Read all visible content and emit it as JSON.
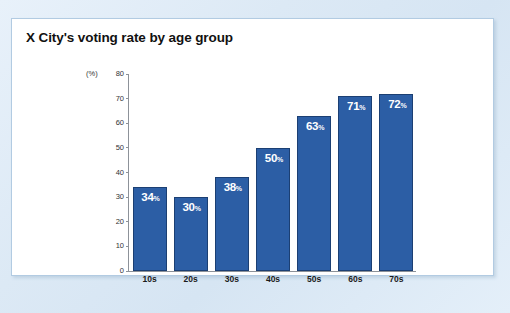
{
  "card": {
    "title": "X City's voting rate by age group",
    "background_color": "#ffffff",
    "border_color": "#b2cbe2"
  },
  "page": {
    "background_color": "#dce9f5"
  },
  "chart_data": {
    "type": "bar",
    "title": "X City's voting rate by age group",
    "xlabel": "",
    "ylabel": "",
    "unit_label": "(%)",
    "categories": [
      "10s",
      "20s",
      "30s",
      "40s",
      "50s",
      "60s",
      "70s"
    ],
    "values": [
      34,
      30,
      38,
      50,
      63,
      71,
      72
    ],
    "value_labels": [
      "34%",
      "30%",
      "38%",
      "50%",
      "63%",
      "71%",
      "72%"
    ],
    "value_suffix": "%",
    "ylim": [
      0,
      80
    ],
    "ytick_step": 10,
    "yticks": [
      80,
      70,
      60,
      50,
      40,
      30,
      20,
      10,
      0
    ],
    "ytick_labels": [
      "80",
      "70",
      "60",
      "50",
      "40",
      "30",
      "20",
      "10",
      "0"
    ],
    "grid": false,
    "legend": false,
    "bar_color": "#2c5ea5",
    "bar_border_color": "#1b3f73",
    "label_color": "#ffffff",
    "axis_color": "#8d9299"
  }
}
